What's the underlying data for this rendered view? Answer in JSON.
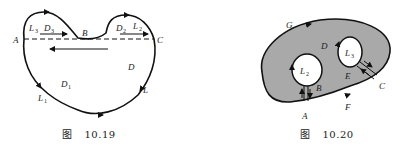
{
  "figures": [
    {
      "id": "10.19",
      "caption_prefix": "图",
      "caption_number": "10.19",
      "labels": {
        "A": "A",
        "B": "B",
        "C": "C",
        "D": "D",
        "D1": "D",
        "D1_sub": "1",
        "D2": "D",
        "D2_sub": "2",
        "D3": "D",
        "D3_sub": "3",
        "L": "L",
        "L1": "L",
        "L1_sub": "1",
        "L2": "L",
        "L2_sub": "2",
        "L3": "L",
        "L3_sub": "3"
      },
      "colors": {
        "stroke": "#111111",
        "fill": "#ffffff"
      }
    },
    {
      "id": "10.20",
      "caption_prefix": "图",
      "caption_number": "10.20",
      "labels": {
        "A": "A",
        "B": "B",
        "C": "C",
        "D": "D",
        "E": "E",
        "F": "F",
        "G": "G",
        "L2": "L",
        "L2_sub": "2",
        "L3": "L",
        "L3_sub": "3"
      },
      "colors": {
        "stroke": "#111111",
        "region_fill": "#a9a9a9",
        "hole_fill": "#ffffff"
      }
    }
  ]
}
